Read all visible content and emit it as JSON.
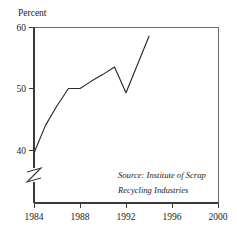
{
  "chart_data": {
    "type": "line",
    "title": "",
    "subtitle": "",
    "xlabel": "",
    "ylabel": "Percent",
    "ylabel_position": "top-left",
    "grid": false,
    "legend": false,
    "axis_break": true,
    "axis_break_note": "y-axis broken below 40",
    "xlim": [
      1984,
      2000
    ],
    "ylim": [
      40,
      60
    ],
    "xticks": [
      1984,
      1988,
      1992,
      1996,
      2000
    ],
    "xtick_labels": [
      "1984",
      "1988",
      "1992",
      "1996",
      "2000"
    ],
    "yticks": [
      40,
      50,
      60
    ],
    "ytick_labels": [
      "40",
      "50",
      "60"
    ],
    "series": [
      {
        "name": "Recycling rate",
        "x": [
          1984,
          1985,
          1986,
          1987,
          1988,
          1989,
          1990,
          1991,
          1992,
          1993,
          1994
        ],
        "values": [
          39.5,
          44.0,
          47.2,
          50.0,
          50.0,
          51.2,
          52.3,
          53.5,
          49.3,
          53.9,
          58.5
        ]
      }
    ],
    "annotations": [
      {
        "name": "source-note",
        "line1": "Source: Institute of Scrap",
        "line2": "Recycling Industries"
      }
    ],
    "colors": {
      "line": "#2b2b2b",
      "axis": "#3a3a3a",
      "frame": "#6b6b6b",
      "background": "#ffffff",
      "text": "#1a1a1a"
    }
  }
}
